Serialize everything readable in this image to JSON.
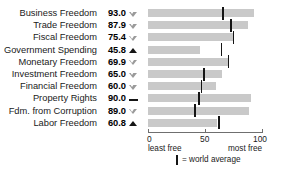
{
  "title_cropped": "WORLD RANK: 6 REGIONAL RANK: 2",
  "chart_data": {
    "type": "bar",
    "title": "",
    "xlabel": "",
    "ylabel": "",
    "xlim": [
      0,
      100
    ],
    "grid": false,
    "orientation": "horizontal",
    "categories": [
      "Business Freedom",
      "Trade Freedom",
      "Fiscal Freedom",
      "Government Spending",
      "Monetary Freedom",
      "Investment Freedom",
      "Financial Freedom",
      "Property Rights",
      "Fdm. from Corruption",
      "Labor Freedom"
    ],
    "values": [
      93.0,
      87.9,
      75.4,
      45.8,
      69.9,
      65.0,
      60.0,
      90.0,
      89.0,
      60.8
    ],
    "value_labels": [
      "93.0",
      "87.9",
      "75.4",
      "45.8",
      "69.9",
      "65.0",
      "60.0",
      "90.0",
      "89.0",
      "60.8"
    ],
    "trend_markers": [
      "triangle-down-open",
      "triangle-down-open",
      "triangle-down-open",
      "triangle-up-filled",
      "triangle-down-open",
      "triangle-down-open",
      "triangle-down-open",
      "dash-flat",
      "triangle-down-open",
      "triangle-up-filled"
    ],
    "world_average": [
      66.0,
      73.0,
      75.0,
      64.5,
      70.5,
      49.0,
      47.0,
      45.0,
      41.0,
      62.0
    ],
    "series": [
      {
        "name": "score",
        "values": [
          93.0,
          87.9,
          75.4,
          45.8,
          69.9,
          65.0,
          60.0,
          90.0,
          89.0,
          60.8
        ]
      },
      {
        "name": "world average",
        "values": [
          66.0,
          73.0,
          75.0,
          64.5,
          70.5,
          49.0,
          47.0,
          45.0,
          41.0,
          62.0
        ]
      }
    ],
    "xticks": [
      0,
      50,
      100
    ],
    "xtick_labels": [
      "0",
      "50",
      "100"
    ],
    "axis_end_labels": {
      "left": "least free",
      "right": "most free"
    },
    "legend": {
      "marker": "vertical-tick",
      "text": "= world average",
      "position": "bottom-center"
    },
    "colors": {
      "bar": "#c9c9c9",
      "average_tick": "#151515",
      "axis": "#6f6f6f",
      "text": "#1a1a1a"
    }
  }
}
